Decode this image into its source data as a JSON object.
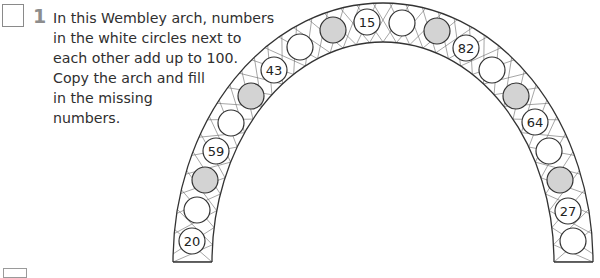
{
  "question": {
    "number": "1",
    "lines": [
      "In this Wembley arch, numbers",
      "in the white circles next to",
      "each other add up to 100.",
      "Copy the arch and fill",
      "in the missing",
      "numbers."
    ]
  },
  "colors": {
    "gray_circle": "#d3d3d3",
    "white_circle": "#ffffff",
    "outline": "#333333",
    "question_number": "#8d8d8d"
  },
  "arch": {
    "circles": [
      {
        "type": "white",
        "label": "20",
        "x": 192,
        "y": 241
      },
      {
        "type": "white",
        "label": "",
        "x": 197,
        "y": 210
      },
      {
        "type": "gray",
        "label": "",
        "x": 205,
        "y": 180
      },
      {
        "type": "white",
        "label": "59",
        "x": 216,
        "y": 151
      },
      {
        "type": "white",
        "label": "",
        "x": 231,
        "y": 123
      },
      {
        "type": "gray",
        "label": "",
        "x": 251,
        "y": 96
      },
      {
        "type": "white",
        "label": "43",
        "x": 274,
        "y": 70
      },
      {
        "type": "white",
        "label": "",
        "x": 300,
        "y": 47
      },
      {
        "type": "gray",
        "label": "",
        "x": 333,
        "y": 30
      },
      {
        "type": "white",
        "label": "15",
        "x": 367,
        "y": 22
      },
      {
        "type": "white",
        "label": "",
        "x": 402,
        "y": 23
      },
      {
        "type": "gray",
        "label": "",
        "x": 437,
        "y": 31
      },
      {
        "type": "white",
        "label": "82",
        "x": 466,
        "y": 48
      },
      {
        "type": "white",
        "label": "",
        "x": 492,
        "y": 70
      },
      {
        "type": "gray",
        "label": "",
        "x": 516,
        "y": 96
      },
      {
        "type": "white",
        "label": "64",
        "x": 535,
        "y": 122
      },
      {
        "type": "white",
        "label": "",
        "x": 549,
        "y": 151
      },
      {
        "type": "gray",
        "label": "",
        "x": 560,
        "y": 180
      },
      {
        "type": "white",
        "label": "27",
        "x": 568,
        "y": 211
      },
      {
        "type": "white",
        "label": "",
        "x": 573,
        "y": 241
      }
    ]
  }
}
